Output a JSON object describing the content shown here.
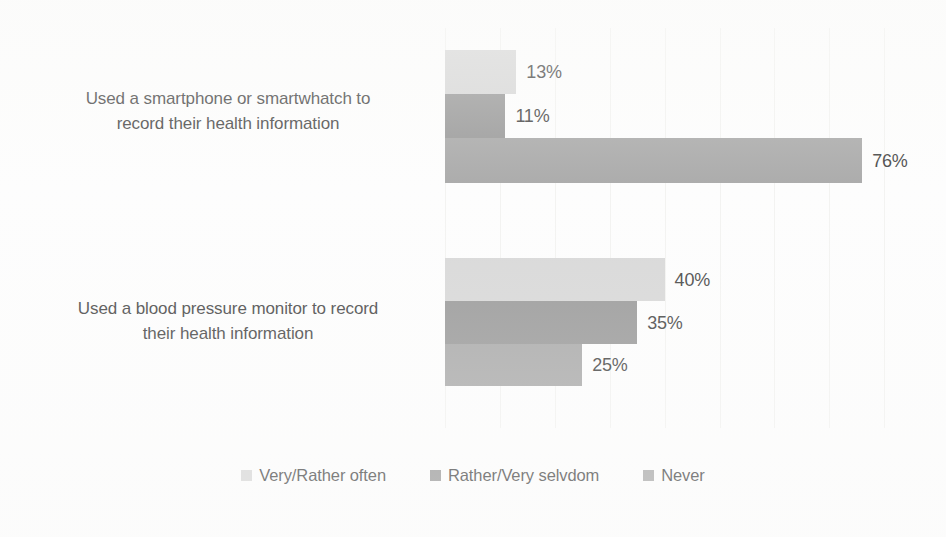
{
  "chart_data": {
    "type": "bar",
    "orientation": "horizontal",
    "title": "",
    "subtitle": "",
    "xlabel": "",
    "ylabel": "",
    "grid": true,
    "grid_axis": "x",
    "legend_position": "bottom",
    "value_suffix": "%",
    "xlim": [
      0,
      80
    ],
    "xtick_labels": [],
    "categories": [
      "Used a smartphone or smartwhatch to record their health information",
      "Used a blood pressure monitor to record their health information"
    ],
    "category_lines": [
      [
        "Used a smartphone or smartwhatch to",
        "record their health information"
      ],
      [
        "Used a blood pressure monitor to record",
        "their health information"
      ]
    ],
    "series": [
      {
        "name": "Very/Rather often",
        "color": "#d2d2d2",
        "values": [
          13,
          40
        ],
        "labels": [
          "13%",
          "40%"
        ]
      },
      {
        "name": "Rather/Very selvdom",
        "color": "#8b8b8b",
        "values": [
          11,
          35
        ],
        "labels": [
          "11%",
          "35%"
        ]
      },
      {
        "name": "Never",
        "color": "#9d9d9d",
        "values": [
          76,
          25
        ],
        "labels": [
          "76%",
          "25%"
        ]
      }
    ]
  },
  "legend": {
    "items": [
      {
        "label": "Very/Rather often",
        "color": "#d2d2d2"
      },
      {
        "label": "Rather/Very selvdom",
        "color": "#8b8b8b"
      },
      {
        "label": "Never",
        "color": "#9d9d9d"
      }
    ]
  },
  "colors": {
    "background": "#fdfdfd",
    "gridline": "#f1f1ef",
    "text": "#2e2e2e",
    "series_very_rather_often": "#d2d2d2",
    "series_rather_very_selvdom": "#8b8b8b",
    "series_never": "#9d9d9d"
  }
}
